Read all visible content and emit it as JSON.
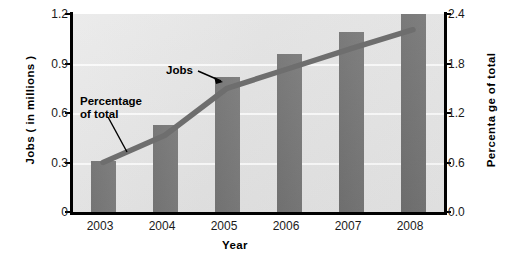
{
  "chart_data": {
    "type": "bar",
    "title": "",
    "xlabel": "Year",
    "categories": [
      "2003",
      "2004",
      "2005",
      "2006",
      "2007",
      "2008"
    ],
    "grid": true,
    "legend_position": "none",
    "series": [
      {
        "name": "Jobs",
        "type": "bar",
        "axis": "left",
        "ylabel": "Jobs ( in millions )",
        "ylim": [
          0,
          1.2
        ],
        "yticks": [
          "0",
          "0.3",
          "0.6",
          "0.9",
          "1.2"
        ],
        "ytick_values": [
          0,
          0.3,
          0.6,
          0.9,
          1.2
        ],
        "values": [
          0.31,
          0.53,
          0.82,
          0.96,
          1.09,
          1.2
        ],
        "color": "#6e6e6e"
      },
      {
        "name": "Percentage of total",
        "type": "line",
        "axis": "right",
        "ylabel": "Percenta ge  of  total",
        "ylim": [
          0.0,
          2.4
        ],
        "yticks": [
          "0.0",
          "0.6",
          "1.2",
          "1.8",
          "2.4"
        ],
        "ytick_values": [
          0.0,
          0.6,
          1.2,
          1.8,
          2.4
        ],
        "values": [
          0.6,
          0.93,
          1.5,
          1.74,
          1.98,
          2.21
        ],
        "color": "#6e6e6e"
      }
    ],
    "annotations": [
      {
        "text": "Percentage\nof  total",
        "target": "percentage-line"
      },
      {
        "text": "Jobs",
        "target": "jobs-bar-2005"
      }
    ],
    "colors": {
      "plot_background": "#e4e4e4",
      "gridline": "#fafafa",
      "series_gray": "#6e6e6e",
      "axis": "#000000",
      "text": "#000000"
    }
  }
}
